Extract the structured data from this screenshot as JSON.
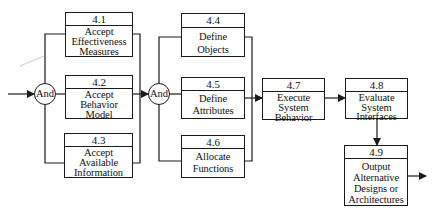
{
  "diagram": {
    "type": "functional-flow-block-diagram",
    "gates": [
      {
        "id": "and1",
        "label": "And"
      },
      {
        "id": "and2",
        "label": "And"
      }
    ],
    "functions": [
      {
        "id": "4.1",
        "number": "4.1",
        "lines": [
          "Accept",
          "Effectiveness",
          "Measures"
        ]
      },
      {
        "id": "4.2",
        "number": "4.2",
        "lines": [
          "Accept",
          "Behavior",
          "Model"
        ]
      },
      {
        "id": "4.3",
        "number": "4.3",
        "lines": [
          "Accept",
          "Available",
          "Information"
        ]
      },
      {
        "id": "4.4",
        "number": "4.4",
        "lines": [
          "Define",
          "Objects"
        ]
      },
      {
        "id": "4.5",
        "number": "4.5",
        "lines": [
          "Define",
          "Attributes"
        ]
      },
      {
        "id": "4.6",
        "number": "4.6",
        "lines": [
          "Allocate",
          "Functions"
        ]
      },
      {
        "id": "4.7",
        "number": "4.7",
        "lines": [
          "Execute",
          "System",
          "Behavior"
        ]
      },
      {
        "id": "4.8",
        "number": "4.8",
        "lines": [
          "Evaluate",
          "System",
          "Interfaces"
        ]
      },
      {
        "id": "4.9",
        "number": "4.9",
        "lines": [
          "Output",
          "Alternative",
          "Designs or",
          "Architectures"
        ]
      }
    ],
    "edges": [
      {
        "from": "input",
        "to": "and1"
      },
      {
        "from": "and1",
        "to": "4.1"
      },
      {
        "from": "and1",
        "to": "4.2"
      },
      {
        "from": "and1",
        "to": "4.3"
      },
      {
        "from": "4.1",
        "to": "and2"
      },
      {
        "from": "4.2",
        "to": "and2"
      },
      {
        "from": "4.3",
        "to": "and2"
      },
      {
        "from": "and2",
        "to": "4.4"
      },
      {
        "from": "and2",
        "to": "4.5"
      },
      {
        "from": "and2",
        "to": "4.6"
      },
      {
        "from": "4.4",
        "to": "4.7"
      },
      {
        "from": "4.5",
        "to": "4.7"
      },
      {
        "from": "4.6",
        "to": "4.7"
      },
      {
        "from": "4.7",
        "to": "4.8"
      },
      {
        "from": "4.8",
        "to": "4.9"
      },
      {
        "from": "4.9",
        "to": "output"
      }
    ]
  },
  "colors": {
    "line": "#1a1a1a",
    "background": "#ffffff",
    "artifact": "#c8c8c8"
  }
}
